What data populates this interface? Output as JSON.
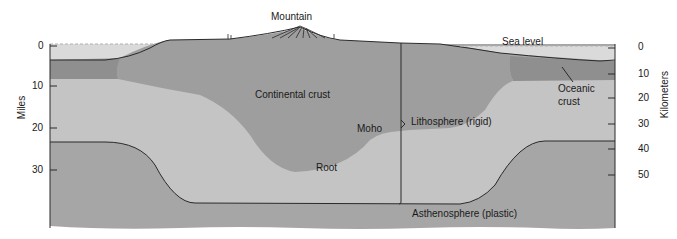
{
  "diagram": {
    "labels": {
      "mountain": "Mountain",
      "sea_level": "Sea level",
      "continental_crust": "Continental crust",
      "oceanic_crust_line1": "Oceanic",
      "oceanic_crust_line2": "crust",
      "moho": "Moho",
      "lithosphere": "Lithosphere (rigid)",
      "root": "Root",
      "asthenosphere": "Asthenosphere (plastic)"
    },
    "left_axis": {
      "title": "Miles",
      "ticks": [
        "0",
        "10",
        "20",
        "30"
      ]
    },
    "right_axis": {
      "title": "Kilometers",
      "ticks": [
        "0",
        "10",
        "20",
        "30",
        "40",
        "50"
      ]
    },
    "colors": {
      "water": "#d9d9d9",
      "oceanic_crust": "#8f8f8f",
      "continental_crust": "#9e9e9e",
      "lithospheric_mantle": "#c4c4c4",
      "asthenosphere": "#a6a6a6",
      "outline": "#2a2a2a"
    }
  }
}
